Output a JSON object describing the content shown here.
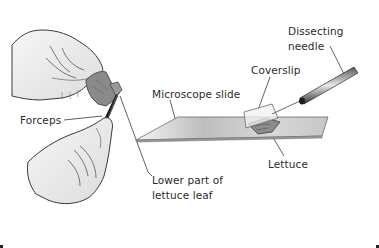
{
  "figure": {
    "labels": {
      "dissecting_needle_line1": "Dissecting",
      "dissecting_needle_line2": "needle",
      "coverslip": "Coverslip",
      "microscope_slide": "Microscope slide",
      "lettuce": "Lettuce",
      "forceps": "Forceps",
      "lower_part_line1": "Lower part of",
      "lower_part_line2": "lettuce leaf"
    },
    "colors": {
      "ink": "#2b2b2b",
      "hand_fill": "#ececec",
      "leaf_fill": "#8a8a8a",
      "slide_fill": "#d4d4d4",
      "background": "#ffffff"
    }
  }
}
